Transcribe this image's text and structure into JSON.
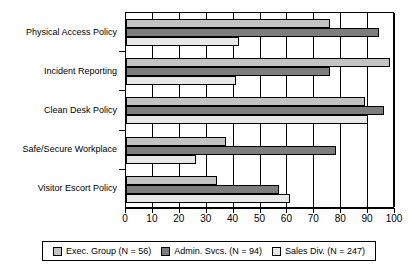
{
  "chart_data": {
    "type": "bar",
    "orientation": "horizontal",
    "title": "",
    "xlabel": "",
    "ylabel": "",
    "xlim": [
      0,
      100
    ],
    "xticks": [
      "0",
      "10",
      "20",
      "30",
      "40",
      "50",
      "60",
      "70",
      "80",
      "90",
      "100"
    ],
    "grid": true,
    "legend_position": "bottom",
    "categories": [
      "Physical Access Policy",
      "Incident Reporting",
      "Clean Desk Policy",
      "Safe/Secure Workplace",
      "Visitor Escort Policy"
    ],
    "series": [
      {
        "name": "Exec. Group (N = 56)",
        "color": "#c3c3c3",
        "values": [
          76,
          98,
          89,
          37,
          34
        ]
      },
      {
        "name": "Admin. Svcs. (N = 94)",
        "color": "#7d7d7d",
        "values": [
          94,
          76,
          96,
          78,
          57
        ]
      },
      {
        "name": "Sales Div. (N = 247)",
        "color": "#e8e8e8",
        "values": [
          42,
          41,
          90,
          26,
          61
        ]
      }
    ]
  },
  "legend": {
    "items": [
      {
        "label": "Exec. Group (N = 56)",
        "swatch_name": "legend-swatch-exec-group"
      },
      {
        "label": "Admin. Svcs. (N = 94)",
        "swatch_name": "legend-swatch-admin-svcs"
      },
      {
        "label": "Sales Div. (N = 247)",
        "swatch_name": "legend-swatch-sales-div"
      }
    ]
  }
}
